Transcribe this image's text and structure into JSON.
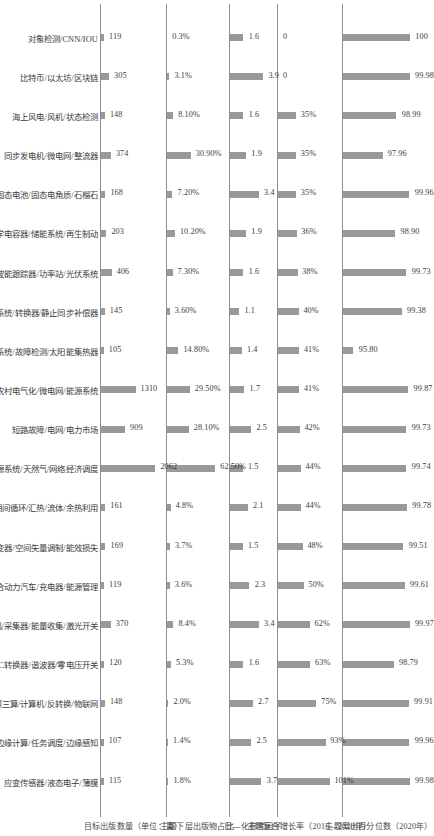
{
  "chart_data": {
    "type": "bar",
    "grid": false,
    "legend": "none",
    "orientation": "rotated-90ccw",
    "categories": [
      "对象检测/CNN/IOU",
      "比特币/以太坊/区块链",
      "海上风电/风机/状态检测",
      "同步发电机/微电网/整流器",
      "固态电池/固态电角质/石榴石",
      "电化学电容器/储能系统/再生制动",
      "电大波能跟踪器/功率站/光伏系统",
      "高压直流系统/转换器/静止同步补偿器",
      "光伏系统/故障检测/太阳能集热器",
      "农村电气化/微电网/能源系统",
      "短路故障/电网/电力市场",
      "综合能源系统/天然气/网络经济调度",
      "期间循环/汇热/流体/余热利用",
      "逆变器/空间矢量调制/能效损失",
      "插电式混合动力汽车/充电器/能源管理",
      "纯水发电机/采集器/能量收集/激光开关",
      "DC-DC转换器/谐波器/零电压开关",
      "第三算/计算机/反转换/物联网",
      "边缘计算/任务调度/边缘感知",
      "应变传感器/液态电子/薄膜"
    ],
    "panels": [
      {
        "title": "主题案出百分位数（2020年）",
        "values": [
          100,
          99.98,
          98.99,
          97.96,
          99.96,
          98.9,
          99.73,
          99.38,
          95.8,
          99.87,
          99.73,
          99.74,
          99.78,
          99.51,
          99.61,
          99.97,
          98.79,
          99.91,
          99.96,
          99.98
        ],
        "labels": [
          "100",
          "99.98",
          "98.99",
          "97.96",
          "99.96",
          "98.90",
          "99.73",
          "99.38",
          "95.80",
          "99.87",
          "99.73",
          "99.74",
          "99.78",
          "99.51",
          "99.61",
          "99.97",
          "98.79",
          "99.91",
          "99.96",
          "99.98"
        ],
        "ylim": [
          95.0,
          100.2
        ]
      },
      {
        "title": "主题复合增长率（2016—2020年）",
        "values": [
          0,
          0,
          35,
          35,
          35,
          36,
          38,
          40,
          41,
          41,
          42,
          44,
          44,
          48,
          50,
          62,
          63,
          75,
          93,
          101
        ],
        "labels": [
          "0",
          "0",
          "35%",
          "35%",
          "35%",
          "36%",
          "38%",
          "40%",
          "41%",
          "41%",
          "42%",
          "44%",
          "44%",
          "48%",
          "50%",
          "62%",
          "63%",
          "75%",
          "93%",
          "101%"
        ],
        "ylim": [
          0,
          110
        ]
      },
      {
        "title": "日—化参考因子",
        "values": [
          1.6,
          3.9,
          1.6,
          1.9,
          3.4,
          1.9,
          1.6,
          1.1,
          1.4,
          1.7,
          2.5,
          1.5,
          2.1,
          1.5,
          2.3,
          3.4,
          1.6,
          2.7,
          2.5,
          3.7
        ],
        "labels": [
          "1.6",
          "3.9",
          "1.6",
          "1.9",
          "3.4",
          "1.9",
          "1.6",
          "1.1",
          "1.4",
          "1.7",
          "2.5",
          "1.5",
          "2.1",
          "1.5",
          "2.3",
          "3.4",
          "1.6",
          "2.7",
          "2.5",
          "3.7"
        ],
        "ylim": [
          0,
          4.2
        ]
      },
      {
        "title": "主题下层出版物占比",
        "values": [
          0.3,
          3.1,
          8.1,
          30.9,
          7.2,
          10.2,
          7.3,
          3.6,
          14.8,
          29.5,
          28.1,
          62.5,
          4.8,
          3.7,
          3.6,
          8.4,
          5.3,
          2.0,
          1.4,
          1.8
        ],
        "labels": [
          "0.3%",
          "3.1%",
          "8.10%",
          "30.90%",
          "7.20%",
          "10.20%",
          "7.30%",
          "3.60%",
          "14.80%",
          "29.50%",
          "28.10%",
          "62.50%",
          "4.8%",
          "3.7%",
          "3.6%",
          "8.4%",
          "5.3%",
          "2.0%",
          "1.4%",
          "1.8%"
        ],
        "ylim": [
          0,
          70
        ]
      },
      {
        "title": "目标出版数量（单位：篇）",
        "values": [
          119,
          305,
          148,
          374,
          168,
          203,
          406,
          145,
          105,
          1310,
          909,
          2062,
          161,
          169,
          119,
          370,
          120,
          148,
          107,
          115
        ],
        "labels": [
          "119",
          "305",
          "148",
          "374",
          "168",
          "203",
          "406",
          "145",
          "105",
          "1310",
          "909",
          "2062",
          "161",
          "169",
          "119",
          "370",
          "120",
          "148",
          "107",
          "115"
        ],
        "ylim": [
          0,
          2200
        ]
      }
    ],
    "bar_color": "#999999",
    "axis_color": "#8d8d8d"
  }
}
